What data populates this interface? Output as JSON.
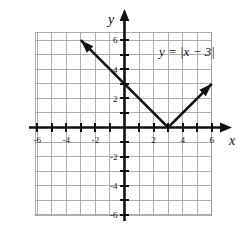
{
  "figure": {
    "equation_label": "y = |x − 3|",
    "x_axis_name": "x",
    "y_axis_name": "y"
  },
  "chart_data": {
    "type": "line",
    "title": "",
    "subtitle": "",
    "xlabel": "x",
    "ylabel": "y",
    "annotations": [
      {
        "text": "y = |x − 3|",
        "x": 4.2,
        "y": 5.0
      }
    ],
    "xlim": [
      -6.5,
      6.5
    ],
    "ylim": [
      -6.5,
      6.5
    ],
    "grid": true,
    "grid_spacing": 1,
    "legend": "none",
    "xticks": [
      -6,
      -5,
      -4,
      -3,
      -2,
      -1,
      1,
      2,
      3,
      4,
      5,
      6
    ],
    "yticks": [
      -6,
      -5,
      -4,
      -3,
      -2,
      -1,
      1,
      2,
      3,
      4,
      5,
      6
    ],
    "xtick_labels": [
      "-6",
      "-4",
      "-2",
      "2",
      "4",
      "6"
    ],
    "xtick_label_values": [
      -6,
      -4,
      -2,
      2,
      4,
      6
    ],
    "ytick_labels": [
      "6",
      "4",
      "2",
      "-2",
      "-4",
      "-6"
    ],
    "ytick_label_values": [
      6,
      4,
      2,
      -2,
      -4,
      -6
    ],
    "series": [
      {
        "name": "y = |x - 3|",
        "function": "absolute value",
        "vertex": [
          3,
          0
        ],
        "y_intercept": 3,
        "x_intercept": 3,
        "left_branch_slope": -1,
        "right_branch_slope": 1,
        "arrow_start": true,
        "arrow_end": true,
        "points": [
          [
            -3,
            6
          ],
          [
            0,
            3
          ],
          [
            3,
            0
          ],
          [
            6,
            3
          ]
        ]
      }
    ]
  },
  "ticks": {
    "x_labels": [
      {
        "value": -6,
        "text": "-6"
      },
      {
        "value": -4,
        "text": "-4"
      },
      {
        "value": -2,
        "text": "-2"
      },
      {
        "value": 2,
        "text": "2"
      },
      {
        "value": 4,
        "text": "4"
      },
      {
        "value": 6,
        "text": "6"
      }
    ],
    "y_labels": [
      {
        "value": 6,
        "text": "6"
      },
      {
        "value": 4,
        "text": "4"
      },
      {
        "value": 2,
        "text": "2"
      },
      {
        "value": -2,
        "text": "-2"
      },
      {
        "value": -4,
        "text": "-4"
      },
      {
        "value": -6,
        "text": "-6"
      }
    ]
  },
  "colors": {
    "axis": "#111111",
    "grid": "#9a9a9a",
    "curve": "#111111",
    "background": "#ffffff"
  }
}
